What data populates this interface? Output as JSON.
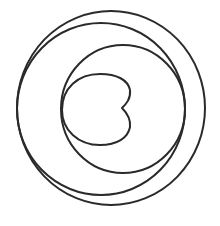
{
  "diagram": {
    "background": "#ffffff",
    "stroke_color": "#2a2a2a",
    "stroke_width": 2,
    "shapes": [
      {
        "name": "outer-circle",
        "type": "ellipse",
        "cx": 111,
        "cy": 108,
        "rx": 94,
        "ry": 97
      },
      {
        "name": "second-circle",
        "type": "ellipse",
        "cx": 101,
        "cy": 109,
        "rx": 84,
        "ry": 86
      },
      {
        "name": "middle-circle",
        "type": "ellipse",
        "cx": 123,
        "cy": 109,
        "rx": 62,
        "ry": 64
      },
      {
        "name": "cardioid",
        "type": "path",
        "d": "M122,108 C126,104 131,99 130,90 C128,80 117,74 100,74 C78,74 62,88 62,110 C62,130 78,145 100,145 C117,145 128,138 130,127 C131,118 126,112 122,108 Z"
      }
    ]
  }
}
